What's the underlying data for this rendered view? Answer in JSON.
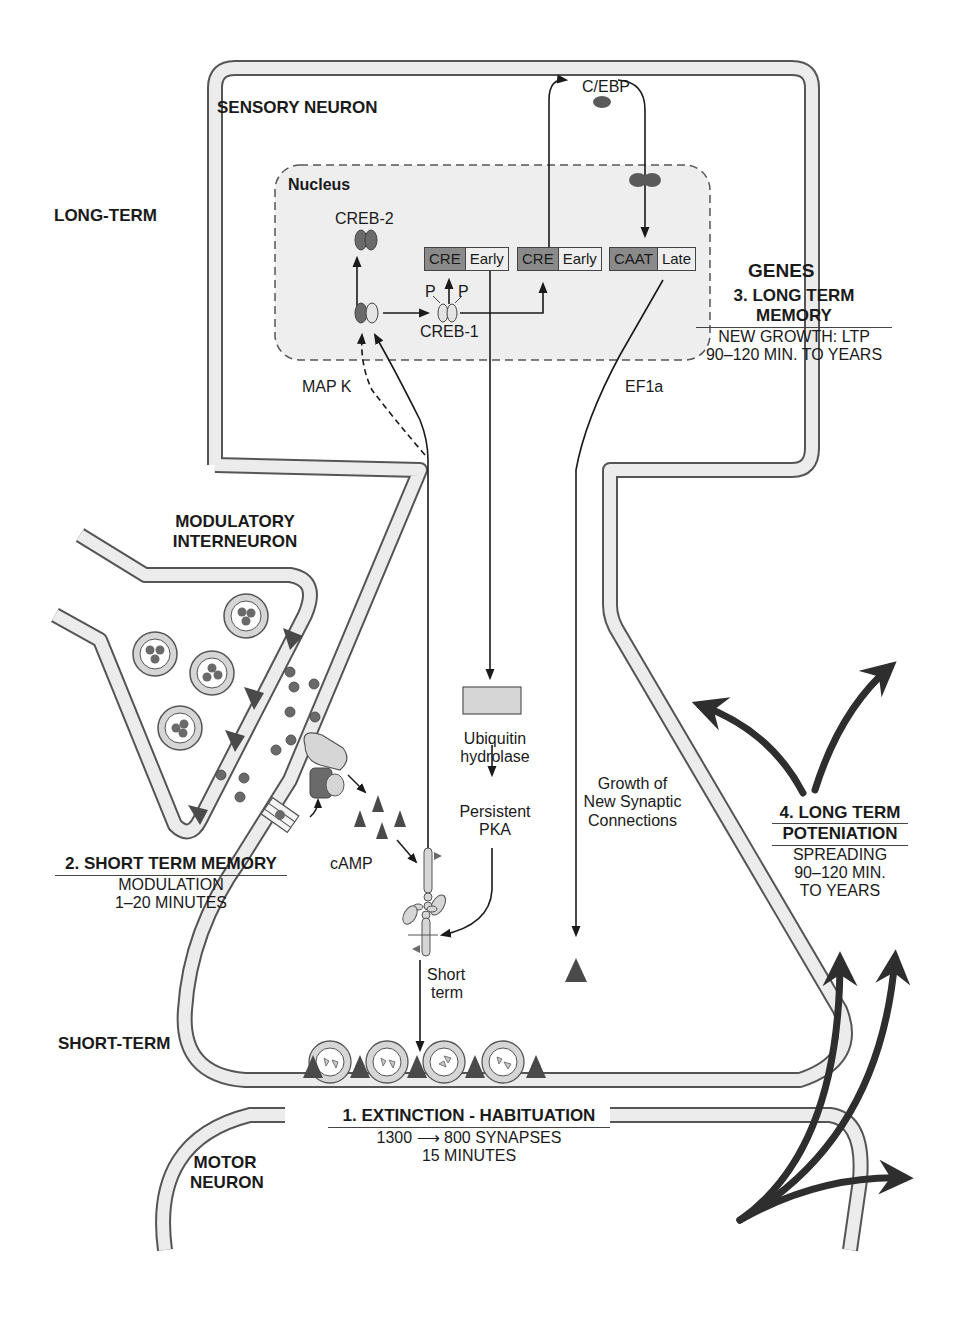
{
  "figure": {
    "regions": {
      "sensory_neuron": "SENSORY NEURON",
      "long_term": "LONG-TERM",
      "modulatory_interneuron_line1": "MODULATORY",
      "modulatory_interneuron_line2": "INTERNEURON",
      "short_term": "SHORT-TERM",
      "motor_neuron_line1": "MOTOR",
      "motor_neuron_line2": "NEURON",
      "nucleus": "Nucleus"
    },
    "molecules": {
      "cebp": "C/EBP",
      "creb2": "CREB-2",
      "creb1": "CREB-1",
      "p_left": "P",
      "p_right": "P",
      "mapk": "MAP K",
      "ef1a": "EF1a",
      "camp": "cAMP",
      "ubiquitin_line1": "Ubiquitin",
      "ubiquitin_line2": "hydrolase",
      "pka_line1": "Persistent",
      "pka_line2": "PKA",
      "growth_line1": "Growth of",
      "growth_line2": "New Synaptic",
      "growth_line3": "Connections",
      "short_line1": "Short",
      "short_line2": "term"
    },
    "gene_boxes": [
      {
        "element": "CRE",
        "type": "Early"
      },
      {
        "element": "CRE",
        "type": "Early"
      },
      {
        "element": "CAAT",
        "type": "Late"
      }
    ],
    "genes_label": "GENES",
    "memory_stages": [
      {
        "title": "1. EXTINCTION - HABITUATION",
        "lines": [
          "1300 ⟶ 800 SYNAPSES",
          "15 MINUTES"
        ]
      },
      {
        "title": "2. SHORT TERM MEMORY",
        "lines": [
          "MODULATION",
          "1–20 MINUTES"
        ]
      },
      {
        "title": "3. LONG TERM MEMORY",
        "lines": [
          "NEW GROWTH: LTP",
          "90–120 MIN. TO YEARS"
        ]
      },
      {
        "title_line1": "4. LONG TERM",
        "title_line2": "POTENIATION",
        "lines": [
          "SPREADING",
          "90–120 MIN.",
          "TO YEARS"
        ]
      }
    ]
  },
  "colors": {
    "membrane_fill": "#ececec",
    "membrane_stroke": "#555555",
    "nucleus_fill": "#eeeeee",
    "dark_molecule": "#5a5a5a",
    "light_molecule": "#d6d6d6",
    "arrow": "#1a1a1a",
    "ltp_arrow": "#2e2e2e"
  }
}
